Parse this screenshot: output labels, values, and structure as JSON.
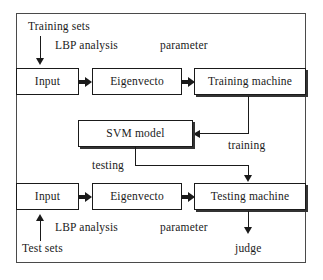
{
  "diagram": {
    "frame": {
      "name": "outer-frame"
    },
    "training_row": {
      "source_label": "Training sets",
      "edge_label_1": "LBP analysis",
      "edge_label_2": "parameter",
      "boxes": [
        {
          "id": "train-input",
          "label": "Input"
        },
        {
          "id": "train-eigenvector",
          "label": "Eigenvecto"
        },
        {
          "id": "training-machine",
          "label": "Training machine"
        }
      ]
    },
    "model": {
      "box": {
        "id": "svm-model",
        "label": "SVM model"
      },
      "training_edge_label": "training",
      "testing_edge_label": "testing"
    },
    "testing_row": {
      "source_label": "Test sets",
      "edge_label_1": "LBP analysis",
      "edge_label_2": "parameter",
      "output_label": "judge",
      "boxes": [
        {
          "id": "test-input",
          "label": "Input"
        },
        {
          "id": "test-eigenvector",
          "label": "Eigenvecto"
        },
        {
          "id": "testing-machine",
          "label": "Testing machine"
        }
      ]
    },
    "colors": {
      "stroke": "#1a1a1a",
      "frame_stroke": "#4a4a4a",
      "background": "#ffffff"
    }
  }
}
